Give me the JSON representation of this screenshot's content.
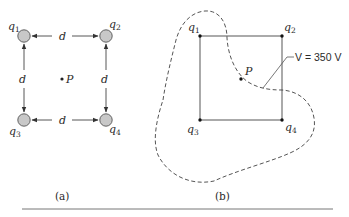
{
  "figure": {
    "panel_a": {
      "caption": "(a)",
      "charges": [
        {
          "name": "q",
          "sub": "1"
        },
        {
          "name": "q",
          "sub": "2"
        },
        {
          "name": "q",
          "sub": "3"
        },
        {
          "name": "q",
          "sub": "4"
        }
      ],
      "distance_label": "d",
      "point_label": "P",
      "charge_fill": "#c8c8c8"
    },
    "panel_b": {
      "caption": "(b)",
      "charges": [
        {
          "name": "q",
          "sub": "1"
        },
        {
          "name": "q",
          "sub": "2"
        },
        {
          "name": "q",
          "sub": "3"
        },
        {
          "name": "q",
          "sub": "4"
        }
      ],
      "point_label": "P",
      "equipotential_label": "V = 350 V"
    }
  }
}
